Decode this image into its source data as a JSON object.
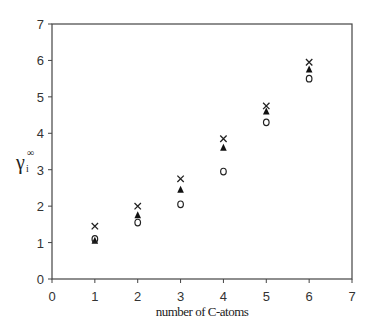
{
  "chart_data": {
    "type": "scatter",
    "title": "",
    "xlabel": "number of C-atoms",
    "ylabel": "γi∞",
    "ylabel_main": "γ",
    "ylabel_sub": "i",
    "ylabel_sup": "∞",
    "xlim": [
      0,
      7
    ],
    "ylim": [
      0,
      7
    ],
    "xticks": [
      "0",
      "1",
      "2",
      "3",
      "4",
      "5",
      "6",
      "7"
    ],
    "yticks": [
      "0",
      "1",
      "2",
      "3",
      "4",
      "5",
      "6",
      "7"
    ],
    "grid": false,
    "legend": "none",
    "x": [
      1,
      2,
      3,
      4,
      5,
      6
    ],
    "series": [
      {
        "name": "cross",
        "marker": "x",
        "values": [
          1.45,
          2.0,
          2.75,
          3.85,
          4.75,
          5.95
        ]
      },
      {
        "name": "filled-triangle",
        "marker": "▲",
        "values": [
          1.05,
          1.75,
          2.45,
          3.6,
          4.6,
          5.75
        ]
      },
      {
        "name": "open-circle",
        "marker": "o",
        "values": [
          1.1,
          1.55,
          2.05,
          2.95,
          4.3,
          5.5
        ]
      }
    ]
  }
}
